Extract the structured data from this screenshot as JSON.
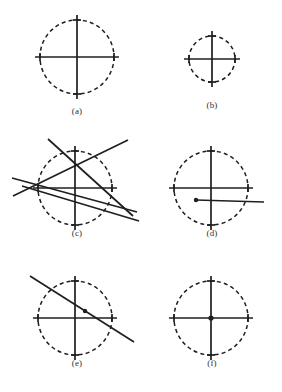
{
  "figure": {
    "background_color": "#ffffff",
    "stroke_color": "#1f1f1f",
    "dash_color": "#1f1f1f",
    "width": 282,
    "height": 392
  },
  "panels": [
    {
      "id": "a",
      "label": "(a)",
      "label_x": 57,
      "label_y": 106,
      "center": [
        77,
        57
      ],
      "radius": 37,
      "circle_style": "dashed",
      "axes": {
        "horizontal": {
          "x1": 35,
          "y1": 57,
          "x2": 119,
          "y2": 57
        },
        "vertical": {
          "x1": 77,
          "y1": 15,
          "x2": 77,
          "y2": 99
        }
      },
      "ticks": [
        {
          "x": 40,
          "y": 57,
          "orientation": "vertical"
        },
        {
          "x": 114,
          "y": 57,
          "orientation": "vertical"
        },
        {
          "x": 77,
          "y": 20,
          "orientation": "horizontal"
        },
        {
          "x": 77,
          "y": 94,
          "orientation": "horizontal"
        }
      ],
      "lines": [],
      "dots": []
    },
    {
      "id": "b",
      "label": "(b)",
      "label_x": 192,
      "label_y": 100,
      "center": [
        212,
        59
      ],
      "radius": 23,
      "circle_style": "dashed",
      "axes": {
        "horizontal": {
          "x1": 184,
          "y1": 59,
          "x2": 240,
          "y2": 59
        },
        "vertical": {
          "x1": 212,
          "y1": 31,
          "x2": 212,
          "y2": 87
        }
      },
      "ticks": [
        {
          "x": 189,
          "y": 59,
          "orientation": "vertical"
        },
        {
          "x": 235,
          "y": 59,
          "orientation": "vertical"
        },
        {
          "x": 212,
          "y": 36,
          "orientation": "horizontal"
        },
        {
          "x": 212,
          "y": 82,
          "orientation": "horizontal"
        }
      ],
      "lines": [],
      "dots": []
    },
    {
      "id": "c",
      "label": "(c)",
      "label_x": 57,
      "label_y": 228,
      "center": [
        75,
        188
      ],
      "radius": 37,
      "circle_style": "dashed",
      "axes": {
        "horizontal": {
          "x1": 33,
          "y1": 188,
          "x2": 117,
          "y2": 188
        },
        "vertical": {
          "x1": 75,
          "y1": 146,
          "x2": 75,
          "y2": 230
        }
      },
      "ticks": [
        {
          "x": 38,
          "y": 188,
          "orientation": "vertical"
        },
        {
          "x": 112,
          "y": 188,
          "orientation": "vertical"
        },
        {
          "x": 75,
          "y": 151,
          "orientation": "horizontal"
        },
        {
          "x": 75,
          "y": 225,
          "orientation": "horizontal"
        }
      ],
      "lines": [
        {
          "x1": 48,
          "y1": 139,
          "x2": 133,
          "y2": 216
        },
        {
          "x1": 13,
          "y1": 196,
          "x2": 128,
          "y2": 140
        },
        {
          "x1": 12,
          "y1": 178,
          "x2": 137,
          "y2": 212
        },
        {
          "x1": 22,
          "y1": 186,
          "x2": 139,
          "y2": 221
        }
      ],
      "dots": []
    },
    {
      "id": "d",
      "label": "(d)",
      "label_x": 192,
      "label_y": 228,
      "center": [
        211,
        188
      ],
      "radius": 37,
      "circle_style": "dashed",
      "axes": {
        "horizontal": {
          "x1": 169,
          "y1": 188,
          "x2": 253,
          "y2": 188
        },
        "vertical": {
          "x1": 211,
          "y1": 146,
          "x2": 211,
          "y2": 230
        }
      },
      "ticks": [
        {
          "x": 174,
          "y": 188,
          "orientation": "vertical"
        },
        {
          "x": 248,
          "y": 188,
          "orientation": "vertical"
        },
        {
          "x": 211,
          "y": 151,
          "orientation": "horizontal"
        },
        {
          "x": 211,
          "y": 225,
          "orientation": "horizontal"
        }
      ],
      "lines": [
        {
          "x1": 196,
          "y1": 200,
          "x2": 264,
          "y2": 202
        }
      ],
      "dots": [
        {
          "x": 196,
          "y": 200,
          "r": 2.2
        }
      ]
    },
    {
      "id": "e",
      "label": "(e)",
      "label_x": 57,
      "label_y": 358,
      "center": [
        75,
        318
      ],
      "radius": 37,
      "circle_style": "dashed",
      "axes": {
        "horizontal": {
          "x1": 33,
          "y1": 318,
          "x2": 117,
          "y2": 318
        },
        "vertical": {
          "x1": 75,
          "y1": 276,
          "x2": 75,
          "y2": 360
        }
      },
      "ticks": [
        {
          "x": 38,
          "y": 318,
          "orientation": "vertical"
        },
        {
          "x": 112,
          "y": 318,
          "orientation": "vertical"
        },
        {
          "x": 75,
          "y": 281,
          "orientation": "horizontal"
        },
        {
          "x": 75,
          "y": 355,
          "orientation": "horizontal"
        }
      ],
      "lines": [
        {
          "x1": 30,
          "y1": 276,
          "x2": 134,
          "y2": 342
        }
      ],
      "dots": [
        {
          "x": 85,
          "y": 311,
          "r": 2.2
        }
      ]
    },
    {
      "id": "f",
      "label": "(f)",
      "label_x": 192,
      "label_y": 358,
      "center": [
        211,
        318
      ],
      "radius": 37,
      "circle_style": "dashed",
      "axes": {
        "horizontal": {
          "x1": 169,
          "y1": 318,
          "x2": 253,
          "y2": 318
        },
        "vertical": {
          "x1": 211,
          "y1": 276,
          "x2": 211,
          "y2": 360
        }
      },
      "ticks": [
        {
          "x": 174,
          "y": 318,
          "orientation": "vertical"
        },
        {
          "x": 248,
          "y": 318,
          "orientation": "vertical"
        },
        {
          "x": 211,
          "y": 281,
          "orientation": "horizontal"
        },
        {
          "x": 211,
          "y": 355,
          "orientation": "horizontal"
        }
      ],
      "lines": [],
      "dots": [
        {
          "x": 211,
          "y": 318,
          "r": 2.6
        }
      ]
    }
  ]
}
